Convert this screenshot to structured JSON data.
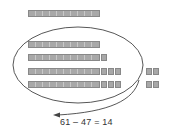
{
  "diagram": {
    "rows": [
      {
        "id": "row-1",
        "tens": 1,
        "ones_inside": 0,
        "ones_outside": 0,
        "circled": false
      },
      {
        "id": "row-2",
        "tens": 1,
        "ones_inside": 0,
        "ones_outside": 0,
        "circled": true
      },
      {
        "id": "row-3",
        "tens": 1,
        "ones_inside": 1,
        "ones_outside": 0,
        "circled": true
      },
      {
        "id": "row-4",
        "tens": 1,
        "ones_inside": 3,
        "ones_outside": 2,
        "circled": true
      },
      {
        "id": "row-5",
        "tens": 1,
        "ones_inside": 3,
        "ones_outside": 2,
        "circled": true
      }
    ],
    "total": 61,
    "removed": 47,
    "remaining": 14,
    "equation": "61 – 47 = 14",
    "colors": {
      "block_fill": "#a8a8a8",
      "block_border": "#888888",
      "ellipse_stroke": "#444444",
      "text": "#333333"
    }
  }
}
